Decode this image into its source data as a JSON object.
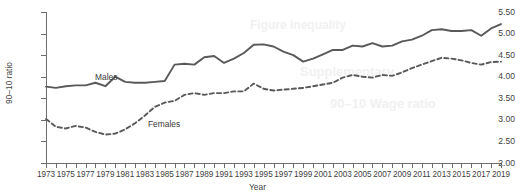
{
  "figure": {
    "title_remnant": "",
    "background_color": "#ffffff",
    "line_color": "#595959"
  },
  "axes": {
    "y_title": "90–10 ratio",
    "x_title": "Year",
    "y_ticks": [
      "2.00",
      "2.50",
      "3.00",
      "3.50",
      "4.00",
      "4.50",
      "5.00",
      "5.50"
    ],
    "x_ticks": [
      "1973",
      "1975",
      "1977",
      "1979",
      "1981",
      "1983",
      "1985",
      "1987",
      "1989",
      "1991",
      "1993",
      "1995",
      "1997",
      "1999",
      "2001",
      "2003",
      "2005",
      "2007",
      "2009",
      "2011",
      "2013",
      "2015",
      "2017",
      "2019"
    ]
  },
  "annotations": {
    "males_label": "Males",
    "females_label": "Females"
  },
  "chart_data": {
    "type": "line",
    "title": "",
    "xlabel": "Year",
    "ylabel": "90–10 ratio",
    "xlim": [
      1973,
      2019
    ],
    "ylim": [
      2.0,
      5.5
    ],
    "ytick_step": 0.5,
    "grid": false,
    "legend_position": "inline-annotation",
    "x": [
      1973,
      1974,
      1975,
      1976,
      1977,
      1978,
      1979,
      1980,
      1981,
      1982,
      1983,
      1984,
      1985,
      1986,
      1987,
      1988,
      1989,
      1990,
      1991,
      1992,
      1993,
      1994,
      1995,
      1996,
      1997,
      1998,
      1999,
      2000,
      2001,
      2002,
      2003,
      2004,
      2005,
      2006,
      2007,
      2008,
      2009,
      2010,
      2011,
      2012,
      2013,
      2014,
      2015,
      2016,
      2017,
      2018,
      2019
    ],
    "series": [
      {
        "name": "Males",
        "style": "solid",
        "color": "#595959",
        "values": [
          3.77,
          3.74,
          3.78,
          3.8,
          3.8,
          3.86,
          3.78,
          4.0,
          3.88,
          3.86,
          3.86,
          3.88,
          3.9,
          4.28,
          4.3,
          4.28,
          4.45,
          4.48,
          4.32,
          4.42,
          4.55,
          4.74,
          4.75,
          4.7,
          4.58,
          4.5,
          4.35,
          4.42,
          4.52,
          4.62,
          4.62,
          4.72,
          4.7,
          4.78,
          4.7,
          4.72,
          4.82,
          4.86,
          4.95,
          5.08,
          5.1,
          5.06,
          5.06,
          5.08,
          4.95,
          5.12,
          5.22
        ]
      },
      {
        "name": "Females",
        "style": "dashed",
        "color": "#595959",
        "values": [
          3.02,
          2.84,
          2.8,
          2.86,
          2.82,
          2.72,
          2.66,
          2.68,
          2.78,
          2.92,
          3.1,
          3.3,
          3.4,
          3.44,
          3.58,
          3.62,
          3.58,
          3.62,
          3.62,
          3.66,
          3.66,
          3.84,
          3.72,
          3.68,
          3.7,
          3.72,
          3.74,
          3.78,
          3.82,
          3.86,
          3.98,
          4.04,
          4.0,
          3.98,
          4.04,
          4.02,
          4.1,
          4.2,
          4.28,
          4.36,
          4.44,
          4.42,
          4.38,
          4.32,
          4.28,
          4.34,
          4.35
        ]
      }
    ]
  }
}
